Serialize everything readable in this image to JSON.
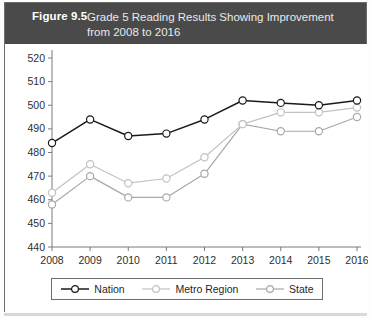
{
  "header": {
    "figure_number": "Figure 9.5",
    "title_line1": "Grade 5 Reading Results Showing Improvement",
    "title_line2": "from 2008 to 2016",
    "background_color": "#4a4a4a",
    "text_color": "#ffffff"
  },
  "chart_data": {
    "type": "line",
    "title": "Grade 5 Reading Results Showing Improvement from 2008 to 2016",
    "xlabel": "",
    "ylabel": "",
    "categories": [
      "2008",
      "2009",
      "2010",
      "2011",
      "2012",
      "2013",
      "2014",
      "2015",
      "2016"
    ],
    "x": [
      2008,
      2009,
      2010,
      2011,
      2012,
      2013,
      2014,
      2015,
      2016
    ],
    "ylim": [
      440,
      520
    ],
    "ytick_step": 10,
    "yticks": [
      440,
      450,
      460,
      470,
      480,
      490,
      500,
      510,
      520
    ],
    "grid": false,
    "legend_position": "bottom",
    "series": [
      {
        "name": "Nation",
        "color": "#1a1a1a",
        "marker": "circle-open",
        "values": [
          484,
          494,
          487,
          488,
          494,
          502,
          501,
          500,
          502
        ]
      },
      {
        "name": "Metro Region",
        "color": "#c2c2c2",
        "marker": "circle-open",
        "values": [
          463,
          475,
          467,
          469,
          478,
          492,
          497,
          497,
          499
        ]
      },
      {
        "name": "State",
        "color": "#a8a8a8",
        "marker": "circle-open",
        "values": [
          458,
          470,
          461,
          461,
          471,
          492,
          489,
          489,
          495
        ]
      }
    ]
  },
  "legend": {
    "items": [
      {
        "label": "Nation"
      },
      {
        "label": "Metro Region"
      },
      {
        "label": "State"
      }
    ]
  }
}
